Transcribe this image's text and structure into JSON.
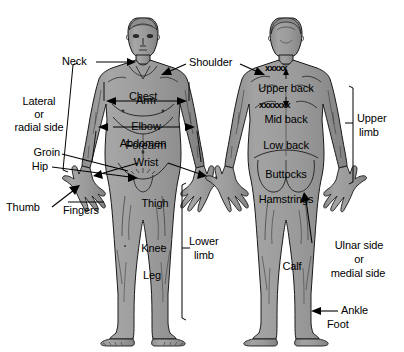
{
  "diagram": {
    "colors": {
      "body_fill": "#9a9a9a",
      "body_fill_light": "#b2b2b2",
      "body_fill_shadow": "#848484",
      "outline": "#1a1a1a",
      "text": "#000000",
      "background": "#ffffff"
    },
    "front_figure": {
      "name": "anterior-body-view",
      "on_body_labels": [
        {
          "id": "chest",
          "text": "Chest"
        },
        {
          "id": "abdomen",
          "text": "Abdomen"
        },
        {
          "id": "thigh",
          "text": "Thigh"
        },
        {
          "id": "knee",
          "text": "Knee"
        },
        {
          "id": "leg",
          "text": "Leg"
        }
      ]
    },
    "back_figure": {
      "name": "posterior-body-view",
      "on_body_labels": [
        {
          "id": "upper-back",
          "text": "Upper back"
        },
        {
          "id": "mid-back",
          "text": "Mid back"
        },
        {
          "id": "low-back",
          "text": "Low back"
        },
        {
          "id": "buttocks",
          "text": "Buttocks"
        },
        {
          "id": "hamstrings",
          "text": "Hamstrings"
        },
        {
          "id": "calf",
          "text": "Calf"
        }
      ],
      "divider_marks": [
        {
          "id": "upper-back-divider",
          "text": "xxxxx"
        },
        {
          "id": "mid-back-divider",
          "text": "xxxxxxx"
        }
      ]
    },
    "callout_labels": [
      {
        "id": "neck",
        "text": "Neck"
      },
      {
        "id": "lateral-or-radial-side",
        "line1": "Lateral",
        "line2": "or",
        "line3": "radial side"
      },
      {
        "id": "groin",
        "text": "Groin"
      },
      {
        "id": "hip",
        "text": "Hip"
      },
      {
        "id": "thumb",
        "text": "Thumb"
      },
      {
        "id": "fingers",
        "text": "Fingers"
      },
      {
        "id": "shoulder",
        "text": "Shoulder"
      },
      {
        "id": "arm",
        "text": "Arm"
      },
      {
        "id": "elbow",
        "text": "Elbow"
      },
      {
        "id": "forearm",
        "text": "Forearm"
      },
      {
        "id": "wrist",
        "text": "Wrist"
      },
      {
        "id": "lower-limb",
        "line1": "Lower",
        "line2": "limb"
      },
      {
        "id": "upper-limb",
        "line1": "Upper",
        "line2": "limb"
      },
      {
        "id": "ulnar-or-medial-side",
        "line1": "Ulnar side",
        "line2": "or",
        "line3": "medial side"
      },
      {
        "id": "ankle",
        "text": "Ankle"
      },
      {
        "id": "foot",
        "text": "Foot"
      }
    ]
  }
}
